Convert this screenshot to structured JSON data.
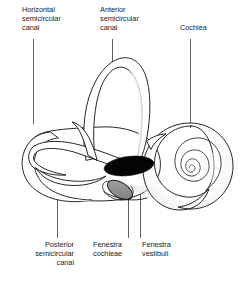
{
  "figure": {
    "caption": "",
    "ink_color": "#1a1a1a",
    "text_color": "#1c1c1c",
    "background_color": "#ffffff",
    "stipple_color": "#9a9a9a",
    "fenestra_vestibuli_fill": "#000000",
    "fenestra_cochleae_fill": "#8d8d8d"
  },
  "labels": {
    "horizontal_canal": "Horizontal\nsemicircular\ncanal",
    "anterior_canal": "Anterior\nsemicircular\ncanal",
    "cochlea": "Cochlea",
    "posterior_canal": "Posterior\nsemicircular\ncanal",
    "fenestra_cochleae": "Fenestra\ncochleae",
    "fenestra_vestibuli": "Fenestra\nvestibuli"
  },
  "leader_lines": [
    {
      "name": "horizontal-canal-leader",
      "x1": 33,
      "y1": 39,
      "x2": 33,
      "y2": 124
    },
    {
      "name": "anterior-canal-leader",
      "x1": 112,
      "y1": 39,
      "x2": 112,
      "y2": 62
    },
    {
      "name": "cochlea-leader",
      "x1": 190,
      "y1": 39,
      "x2": 190,
      "y2": 128
    },
    {
      "name": "posterior-canal-leader",
      "x1": 57,
      "y1": 196,
      "x2": 57,
      "y2": 238
    },
    {
      "name": "fenestra-cochleae-leader",
      "x1": 128,
      "y1": 192,
      "x2": 128,
      "y2": 238
    },
    {
      "name": "fenestra-vestibuli-leader",
      "x1": 140,
      "y1": 170,
      "x2": 140,
      "y2": 238
    }
  ]
}
